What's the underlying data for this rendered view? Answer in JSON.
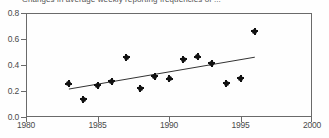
{
  "figure": {
    "title": "Changes in average weekly reporting frequencies of ...",
    "background_color": "#ffffff",
    "axis_color": "#6a6a6a",
    "marker_color": "#111111",
    "trendline_color": "#333333"
  },
  "chart_data": {
    "type": "scatter",
    "title": "Changes in average weekly reporting frequencies of ...",
    "xlabel": "",
    "ylabel": "",
    "xlim": [
      1980,
      2000
    ],
    "ylim": [
      0.0,
      0.8
    ],
    "grid": false,
    "legend": null,
    "xticks": [
      1980,
      1985,
      1990,
      1995,
      2000
    ],
    "xtick_labels": [
      "1980",
      "1985",
      "1990",
      "1995",
      "2000"
    ],
    "yticks": [
      0.0,
      0.2,
      0.4,
      0.6,
      0.8
    ],
    "ytick_labels": [
      "0.0",
      "0.2",
      "0.4",
      "0.6",
      "0.8"
    ],
    "x": [
      1983,
      1984,
      1985,
      1986,
      1987,
      1988,
      1989,
      1990,
      1991,
      1992,
      1993,
      1994,
      1995,
      1996
    ],
    "y": [
      0.255,
      0.135,
      0.245,
      0.275,
      0.46,
      0.22,
      0.315,
      0.295,
      0.445,
      0.465,
      0.415,
      0.26,
      0.3,
      0.66
    ],
    "series": [
      {
        "name": "observations",
        "marker": "diamond",
        "x": [
          1983,
          1984,
          1985,
          1986,
          1987,
          1988,
          1989,
          1990,
          1991,
          1992,
          1993,
          1994,
          1995,
          1996
        ],
        "values": [
          0.255,
          0.135,
          0.245,
          0.275,
          0.46,
          0.22,
          0.315,
          0.295,
          0.445,
          0.465,
          0.415,
          0.26,
          0.3,
          0.66
        ]
      },
      {
        "name": "trend-line",
        "type": "line",
        "x": [
          1983,
          1996
        ],
        "values": [
          0.215,
          0.46
        ]
      }
    ]
  }
}
